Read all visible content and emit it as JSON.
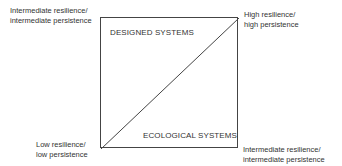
{
  "corners": {
    "top_left": {
      "line1": "Intermediate resilience/",
      "line2": "intermediate persistence"
    },
    "top_right": {
      "line1": "High resilience/",
      "line2": "high persistence"
    },
    "bottom_left": {
      "line1": "Low resilience/",
      "line2": "low persistence"
    },
    "bottom_right": {
      "line1": "Intermediate resilience/",
      "line2": "intermediate  persistence"
    }
  },
  "regions": {
    "upper": "DESIGNED SYSTEMS",
    "lower": "ECOLOGICAL SYSTEMS"
  }
}
